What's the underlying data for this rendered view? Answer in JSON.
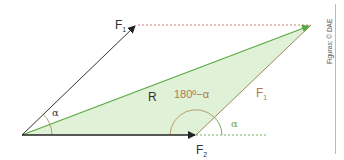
{
  "diagram": {
    "labels": {
      "f1_top": "F",
      "f1_top_sub": "1",
      "f1_side": "F",
      "f1_side_sub": "1",
      "f2": "F",
      "f2_sub": "2",
      "resultant": "R",
      "alpha_origin": "α",
      "alpha_right": "α",
      "supplementary_angle": "180º−α"
    },
    "credit": "Figuras: © DAE",
    "colors": {
      "fill": "#dff1d6",
      "resultant_line": "#5aa840",
      "vector": "#333333",
      "dashed_top": "#d08080",
      "dashed_bottom": "#77b060",
      "angle_arc": "#b8a070",
      "f1_side_color": "#b07850",
      "angle_text": "#b07850"
    }
  }
}
